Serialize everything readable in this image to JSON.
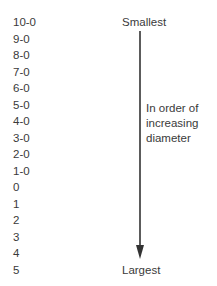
{
  "sizes": [
    "10-0",
    "9-0",
    "8-0",
    "7-0",
    "6-0",
    "5-0",
    "4-0",
    "3-0",
    "2-0",
    "1-0",
    "0",
    "1",
    "2",
    "3",
    "4",
    "5"
  ],
  "labels": {
    "top": "Smallest",
    "bottom": "Largest",
    "note_line1": "In order of",
    "note_line2": "increasing",
    "note_line3": "diameter"
  },
  "colors": {
    "text": "#3a3a3a",
    "arrow": "#333333"
  }
}
